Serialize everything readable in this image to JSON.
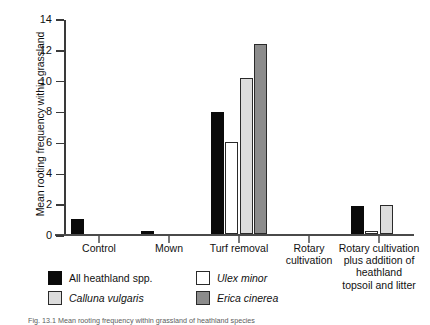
{
  "figure": {
    "caption": "Fig. 13.1 Mean rooting frequency within grassland of heathland species"
  },
  "chart_data": {
    "type": "bar",
    "title": "",
    "xlabel": "",
    "ylabel": "Mean rooting frequency within grassland",
    "ylim": [
      0,
      14
    ],
    "ytick_labels": [
      "0",
      "2",
      "4",
      "6",
      "8",
      "10",
      "12",
      "14"
    ],
    "ytick_values": [
      0,
      2,
      4,
      6,
      8,
      10,
      12,
      14
    ],
    "grid": false,
    "legend_position": "below",
    "categories": [
      "Control",
      "Mown",
      "Turf removal",
      "Rotary\ncultivation",
      "Rotary cultivation\nplus addition of\nheathland\ntopsoil and litter"
    ],
    "category_lines": [
      [
        "Control"
      ],
      [
        "Mown"
      ],
      [
        "Turf removal"
      ],
      [
        "Rotary",
        "cultivation"
      ],
      [
        "Rotary cultivation",
        "plus addition of",
        "heathland",
        "topsoil and litter"
      ]
    ],
    "series": [
      {
        "name": "All heathland spp.",
        "italic": false,
        "color": "#0a0a0a",
        "values": [
          1.0,
          0.2,
          7.9,
          0.0,
          1.8
        ]
      },
      {
        "name": "Ulex minor",
        "italic": true,
        "color": "#ffffff",
        "values": [
          0.0,
          0.0,
          6.0,
          0.0,
          0.2
        ]
      },
      {
        "name": "Calluna vulgaris",
        "italic": true,
        "color": "#dcdcdc",
        "values": [
          0.0,
          0.0,
          10.1,
          0.0,
          1.9
        ]
      },
      {
        "name": "Erica cinerea",
        "italic": true,
        "color": "#8c8c8c",
        "values": [
          0.0,
          0.0,
          12.3,
          0.0,
          0.0
        ]
      }
    ]
  },
  "legend": {
    "entries": [
      {
        "label": "All heathland spp.",
        "italic": false,
        "swatch": "s0"
      },
      {
        "label": "Ulex minor",
        "italic": true,
        "swatch": "s1"
      },
      {
        "label": "Calluna vulgaris",
        "italic": true,
        "swatch": "s2"
      },
      {
        "label": "Erica cinerea",
        "italic": true,
        "swatch": "s3"
      }
    ]
  }
}
